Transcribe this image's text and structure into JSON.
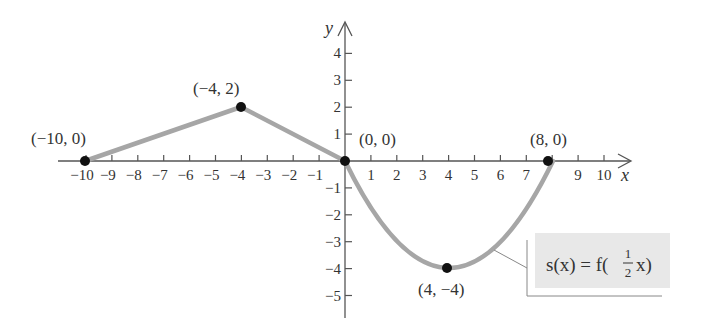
{
  "chart_data": {
    "type": "line",
    "title": "",
    "xlabel": "x",
    "ylabel": "y",
    "xlim": [
      -10,
      10
    ],
    "ylim": [
      -5,
      4
    ],
    "grid": false,
    "x_ticks": [
      -10,
      -9,
      -8,
      -7,
      -6,
      -5,
      -4,
      -3,
      -2,
      -1,
      1,
      2,
      3,
      4,
      5,
      6,
      7,
      8,
      9,
      10
    ],
    "x_tick_labels": [
      "−10",
      "−9",
      "−8",
      "−7",
      "−6",
      "−5",
      "−4",
      "−3",
      "−2",
      "−1",
      "1",
      "2",
      "3",
      "4",
      "5",
      "6",
      "7",
      "",
      "9",
      "10"
    ],
    "y_ticks": [
      4,
      3,
      2,
      1,
      -1,
      -2,
      -3,
      -4,
      -5
    ],
    "y_tick_labels": [
      "4",
      "3",
      "2",
      "1",
      "−1",
      "−2",
      "−3",
      "−4",
      "−5"
    ],
    "series": [
      {
        "name": "s(x) = f(½x)",
        "color": "#a6a6a6",
        "segments": [
          {
            "kind": "linear",
            "from": [
              -10,
              0
            ],
            "to": [
              -4,
              2
            ]
          },
          {
            "kind": "linear",
            "from": [
              -4,
              2
            ],
            "to": [
              0,
              0
            ]
          },
          {
            "kind": "parabola",
            "from": [
              0,
              0
            ],
            "vertex": [
              4,
              -4
            ],
            "to": [
              8,
              0
            ]
          }
        ],
        "key_points": [
          [
            -10,
            0
          ],
          [
            -4,
            2
          ],
          [
            0,
            0
          ],
          [
            4,
            -4
          ],
          [
            8,
            0
          ]
        ]
      }
    ],
    "annotations": [
      {
        "text": "(−10, 0)",
        "at": [
          -10,
          0
        ]
      },
      {
        "text": "(−4, 2)",
        "at": [
          -4,
          2
        ]
      },
      {
        "text": "(0, 0)",
        "at": [
          0,
          0
        ]
      },
      {
        "text": "(8, 0)",
        "at": [
          8,
          0
        ]
      },
      {
        "text": "(4, −4)",
        "at": [
          4,
          -4
        ]
      }
    ],
    "legend": {
      "position": "lower-right",
      "text_prefix": "s(x) = f(",
      "frac_num": "1",
      "frac_den": "2",
      "text_suffix": "x)",
      "background": "#e8e8e8"
    }
  },
  "labels": {
    "x_axis": "x",
    "y_axis": "y",
    "p1": "(−10, 0)",
    "p2": "(−4, 2)",
    "p3": "(0, 0)",
    "p4": "(8, 0)",
    "p5": "(4, −4)"
  },
  "formula": {
    "prefix": "s(x) = f(",
    "num": "1",
    "den": "2",
    "suffix": "x)"
  }
}
